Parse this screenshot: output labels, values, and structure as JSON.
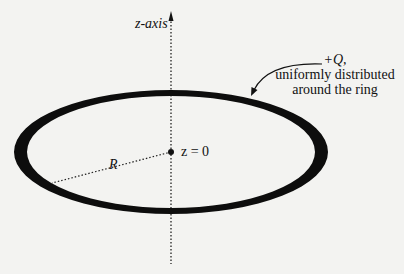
{
  "diagram": {
    "labels": {
      "axis": "z-axis",
      "origin": "z = 0",
      "radius": "R",
      "charge": "+Q,",
      "charge_desc_line1": "uniformly distributed",
      "charge_desc_line2": "around the ring"
    },
    "elements": [
      {
        "type": "ring",
        "description": "thick black ellipse in perspective",
        "center": [
          171,
          152
        ],
        "rx": 157,
        "ry": 62
      },
      {
        "type": "axis",
        "description": "dotted vertical z-axis with arrow at top",
        "x": 171,
        "y_top": 12,
        "y_bottom": 262
      },
      {
        "type": "radius-line",
        "description": "dotted line from center to ring",
        "from": [
          171,
          152
        ],
        "to": [
          52,
          183
        ]
      },
      {
        "type": "center-dot",
        "at": [
          171,
          152
        ]
      },
      {
        "type": "pointer-arrow",
        "description": "curved arrow from charge label to ring",
        "from": [
          323,
          64
        ],
        "to": [
          252,
          92
        ]
      }
    ],
    "colors": {
      "background": "#f3f3f1",
      "ink": "#111111"
    }
  }
}
